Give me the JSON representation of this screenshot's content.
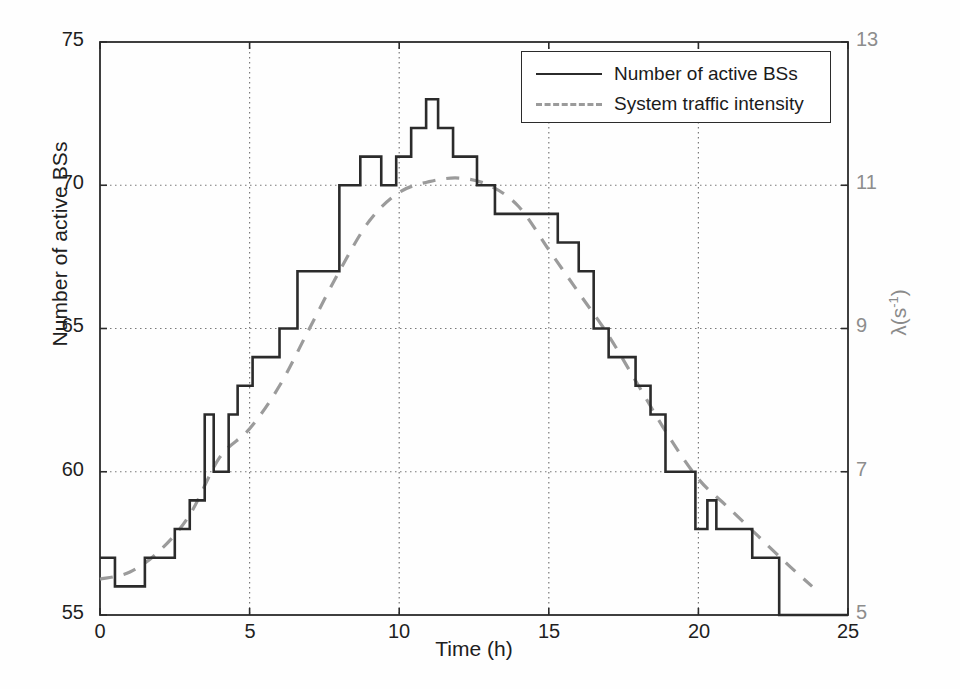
{
  "chart_data": {
    "type": "line",
    "title": "",
    "subtitle": "",
    "xlabel": "Time (h)",
    "ylabel": "Number of active BSs",
    "ylabel_right": "λ(s⁻¹)",
    "xlim": [
      0,
      25
    ],
    "ylim": [
      55,
      75
    ],
    "ylim_right": [
      5,
      13
    ],
    "xticks": [
      0,
      5,
      10,
      15,
      20,
      25
    ],
    "yticks": [
      55,
      60,
      65,
      70,
      75
    ],
    "yticks_right": [
      5,
      7,
      9,
      11,
      13
    ],
    "grid": true,
    "grid_style": "dotted",
    "legend_position": "top-right",
    "legend": [
      "Number of active BSs",
      "System traffic intensity"
    ],
    "series": [
      {
        "name": "Number of active BSs",
        "style": "solid",
        "drawstyle": "steps-post",
        "color": "#2b2b2b",
        "axis": "left",
        "points": [
          [
            0.5,
            57
          ],
          [
            1.5,
            56
          ],
          [
            2.5,
            57
          ],
          [
            3.0,
            58
          ],
          [
            3.5,
            59
          ],
          [
            3.8,
            62
          ],
          [
            4.3,
            60
          ],
          [
            4.6,
            62
          ],
          [
            5.1,
            63
          ],
          [
            6.0,
            64
          ],
          [
            6.6,
            65
          ],
          [
            8.0,
            67
          ],
          [
            8.7,
            70
          ],
          [
            9.4,
            71
          ],
          [
            9.9,
            70
          ],
          [
            10.4,
            71
          ],
          [
            10.9,
            72
          ],
          [
            11.3,
            73
          ],
          [
            11.8,
            72
          ],
          [
            12.6,
            71
          ],
          [
            13.2,
            70
          ],
          [
            15.3,
            69
          ],
          [
            16.0,
            68
          ],
          [
            16.5,
            67
          ],
          [
            17.0,
            65
          ],
          [
            17.9,
            64
          ],
          [
            18.4,
            63
          ],
          [
            18.9,
            62
          ],
          [
            19.9,
            60
          ],
          [
            20.3,
            58
          ],
          [
            20.6,
            59
          ],
          [
            21.8,
            58
          ],
          [
            22.7,
            57
          ],
          [
            23.5,
            55
          ]
        ]
      },
      {
        "name": "System traffic intensity",
        "style": "dashed",
        "drawstyle": "smooth",
        "color": "#9b9b9b",
        "axis": "right",
        "points": [
          [
            0.0,
            5.5
          ],
          [
            1.0,
            5.6
          ],
          [
            2.0,
            5.9
          ],
          [
            3.0,
            6.4
          ],
          [
            4.0,
            7.2
          ],
          [
            5.0,
            7.6
          ],
          [
            6.0,
            8.2
          ],
          [
            7.0,
            9.0
          ],
          [
            8.0,
            9.8
          ],
          [
            9.0,
            10.5
          ],
          [
            10.0,
            10.9
          ],
          [
            11.0,
            11.05
          ],
          [
            12.0,
            11.1
          ],
          [
            13.0,
            11.0
          ],
          [
            14.0,
            10.7
          ],
          [
            15.0,
            10.1
          ],
          [
            16.0,
            9.5
          ],
          [
            17.0,
            8.9
          ],
          [
            18.0,
            8.2
          ],
          [
            19.0,
            7.5
          ],
          [
            20.0,
            6.9
          ],
          [
            21.0,
            6.5
          ],
          [
            22.0,
            6.1
          ],
          [
            23.0,
            5.7
          ],
          [
            23.8,
            5.4
          ]
        ]
      }
    ]
  },
  "axes": {
    "x_ticks_text": [
      "0",
      "5",
      "10",
      "15",
      "20",
      "25"
    ],
    "y_left_ticks_text": [
      "75",
      "70",
      "65",
      "60",
      "55"
    ],
    "y_right_ticks_text": [
      "13",
      "11",
      "9",
      "7",
      "5"
    ],
    "x_axis_title": "Time (h)",
    "y_left_axis_title": "Number of active BSs",
    "y_right_axis_title_base": "λ(s",
    "y_right_axis_title_sup": "-1",
    "y_right_axis_title_close": ")"
  },
  "legend": {
    "items": [
      {
        "label": "Number of active BSs",
        "key": "solid-line-key"
      },
      {
        "label": "System traffic intensity",
        "key": "dashed-line-key"
      }
    ]
  },
  "colors": {
    "series_primary": "#2b2b2b",
    "series_secondary": "#9b9b9b",
    "axis": "#2b2b2b",
    "grid": "#7a7a7a",
    "right_axis_text": "#8d8d8d"
  }
}
